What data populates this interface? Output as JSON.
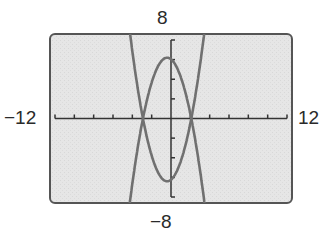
{
  "window": {
    "xmin_label": "−12",
    "xmax_label": "12",
    "ymax_label": "8",
    "ymin_label": "−8",
    "xmin": -12,
    "xmax": 12,
    "xscl": 2,
    "ymin": -8,
    "ymax": 8,
    "yscl": 2
  },
  "colors": {
    "screen_bg": "#e4e4e4",
    "frame": "#555555",
    "axes": "#333333",
    "curve": "#6e6e6e"
  },
  "chart_data": {
    "type": "line",
    "title": "",
    "xlabel": "",
    "ylabel": "",
    "xlim": [
      -12,
      12
    ],
    "ylim": [
      -8,
      8
    ],
    "grid": false,
    "tick_spacing": {
      "x": 2,
      "y": 2
    },
    "series": [
      {
        "name": "downward parabola",
        "approx_equation": "y = 6.2 - (x + 0.4)^2",
        "vertex": [
          -0.4,
          6.2
        ],
        "x_intercepts": [
          -2.9,
          2.1
        ],
        "x": [
          -4.0,
          -3.5,
          -3.0,
          -2.5,
          -2.0,
          -1.5,
          -1.0,
          -0.4,
          0.0,
          0.5,
          1.0,
          1.5,
          2.0,
          2.5,
          3.0
        ],
        "y": [
          -6.8,
          -3.4,
          -0.6,
          1.6,
          3.6,
          4.6,
          5.8,
          6.2,
          6.0,
          5.4,
          4.2,
          2.6,
          0.4,
          -2.2,
          -5.4
        ]
      },
      {
        "name": "upward parabola",
        "approx_equation": "y = -6.4 + (x + 0.4)^2",
        "vertex": [
          -0.4,
          -6.4
        ],
        "x_intercepts": [
          -2.9,
          2.1
        ],
        "x": [
          -4.0,
          -3.5,
          -3.0,
          -2.5,
          -2.0,
          -1.5,
          -1.0,
          -0.4,
          0.0,
          0.5,
          1.0,
          1.5,
          2.0,
          2.5,
          3.0
        ],
        "y": [
          6.6,
          3.2,
          0.4,
          -2.0,
          -3.8,
          -5.2,
          -6.0,
          -6.4,
          -6.2,
          -5.6,
          -4.4,
          -2.8,
          -0.6,
          2.0,
          5.2
        ]
      }
    ]
  }
}
